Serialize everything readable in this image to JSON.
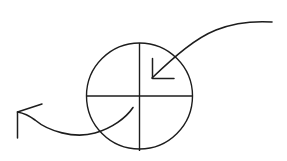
{
  "canvas": {
    "width": 287,
    "height": 161,
    "background_color": "#ffffff",
    "stroke_color": "#1d1d1d",
    "title": "Hand-drawn circle with crosshair and two curved pointer arrows"
  },
  "figure": {
    "name": "crosshair-circle-with-arrows",
    "elements": [
      {
        "name": "circle-outline",
        "type": "circle",
        "center_x": 139.5,
        "center_y": 96,
        "radius": 53
      },
      {
        "name": "vertical-crosshair-line",
        "type": "line",
        "x1": 139.5,
        "y1": 43,
        "x2": 139.5,
        "y2": 151
      },
      {
        "name": "horizontal-crosshair-line",
        "type": "line",
        "x1": 87,
        "y1": 96,
        "x2": 192,
        "y2": 96
      },
      {
        "name": "incoming-arrow-top-right",
        "type": "curved-arrow",
        "direction": "down-left",
        "tail_x": 272,
        "tail_y": 22,
        "tip_x": 152,
        "tip_y": 78,
        "target_quadrant": "upper-right"
      },
      {
        "name": "outgoing-arrow-bottom-left",
        "type": "curved-arrow",
        "direction": "left",
        "tail_x": 133,
        "tail_y": 108,
        "tip_x": 17,
        "tip_y": 112,
        "source_quadrant": "lower-left"
      }
    ],
    "paths": {
      "circle_path": "M 192.5 96 A 53 53 0 1 1 86.5 96 A 53 53 0 1 1 192.5 96",
      "vertical_line_path": "M 139.5 43 L 139.5 151",
      "horizontal_line_path": "M 87 96 L 192 96",
      "top_arrow_curve_path": "M 272 22 C 255 21 236 22 216 30 C 196 38 176 55 152 78",
      "top_arrow_head_path": "M 152.5 58.5 L 152.5 78.5 L 174 78.5",
      "bottom_arrow_curve_path": "M 133 107.5 C 126 118 112 128 95 133 C 74 139 48 131 35 120 C 29 115.5 23 113 17.5 112",
      "bottom_arrow_head_path": "M 17.5 112 L 17.5 138 M 17.5 112 L 42 104"
    }
  }
}
